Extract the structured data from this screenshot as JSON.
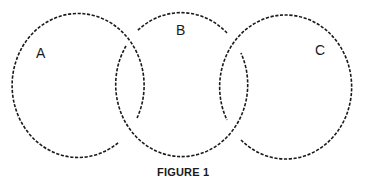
{
  "diagram": {
    "type": "venn-like-interlocking-circles",
    "circles": [
      {
        "id": "A",
        "label": "A",
        "center": [
          81,
          85
        ],
        "rx": 66,
        "ry": 72
      },
      {
        "id": "B",
        "label": "B",
        "center": [
          181,
          85
        ],
        "rx": 66,
        "ry": 72
      },
      {
        "id": "C",
        "label": "C",
        "center": [
          287,
          87
        ],
        "rx": 66,
        "ry": 72
      }
    ],
    "line_style": "dashed",
    "stroke_color": "#1a1a1a",
    "caption": "FIGURE 1"
  }
}
